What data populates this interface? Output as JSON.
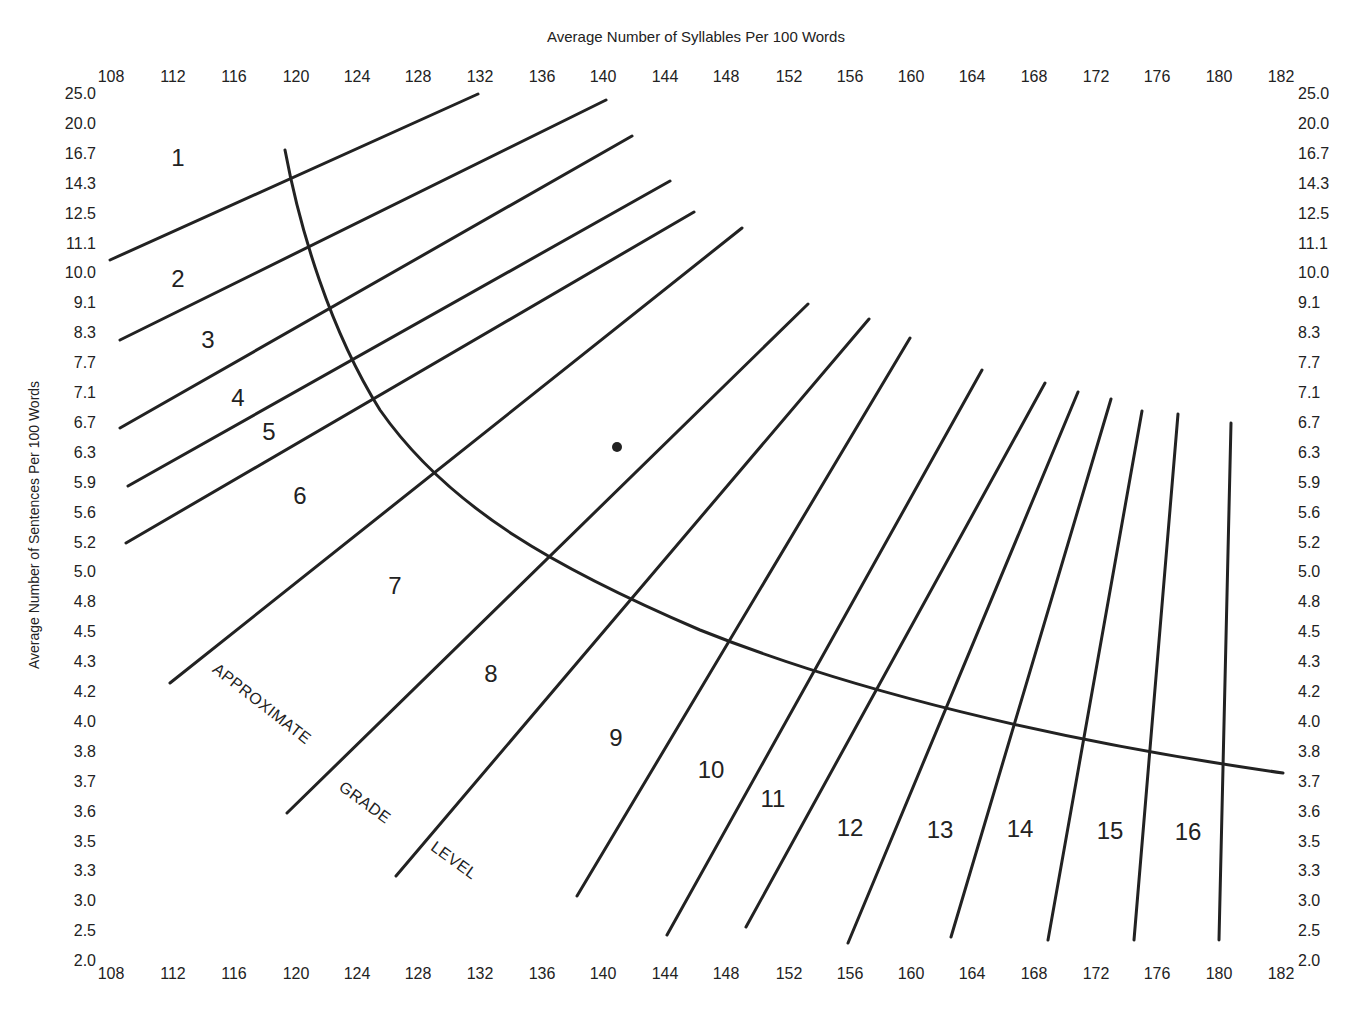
{
  "chart_data": {
    "type": "line",
    "title": "Average Number of Syllables Per 100 Words",
    "xlabel": "Average Number of Syllables Per 100 Words",
    "ylabel": "Average Number of Sentences Per 100 Words",
    "x_ticks": [
      "108",
      "112",
      "116",
      "120",
      "124",
      "128",
      "132",
      "136",
      "140",
      "144",
      "148",
      "152",
      "156",
      "160",
      "164",
      "168",
      "172",
      "176",
      "180",
      "182"
    ],
    "y_ticks": [
      "25.0",
      "20.0",
      "16.7",
      "14.3",
      "12.5",
      "11.1",
      "10.0",
      "9.1",
      "8.3",
      "7.7",
      "7.1",
      "6.7",
      "6.3",
      "5.9",
      "5.6",
      "5.2",
      "5.0",
      "4.8",
      "4.5",
      "4.3",
      "4.2",
      "4.0",
      "3.8",
      "3.7",
      "3.6",
      "3.5",
      "3.3",
      "3.0",
      "2.5",
      "2.0"
    ],
    "grade_labels": [
      "1",
      "2",
      "3",
      "4",
      "5",
      "6",
      "7",
      "8",
      "9",
      "10",
      "11",
      "12",
      "13",
      "14",
      "15",
      "16"
    ],
    "annotation": [
      "APPROXIMATE",
      "GRADE",
      "LEVEL"
    ],
    "plotted_point": {
      "syllables": 141,
      "sentences": 6.3
    },
    "grid": false,
    "legend": "none"
  }
}
